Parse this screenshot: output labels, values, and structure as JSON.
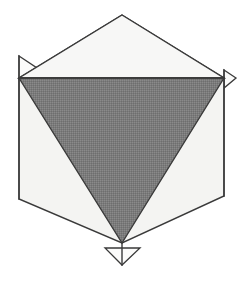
{
  "figure": {
    "type": "geometric-line-drawing",
    "width": 247,
    "height": 283,
    "background_color": "#ffffff",
    "colors": {
      "background": "#ffffff",
      "outline_stroke": "#3a3a3a",
      "light_face_fill": "#f4f4f2",
      "upper_face_fill": "#f7f7f6",
      "shaded_triangle_fill": "#787878",
      "flap_fill": "#fbfbfa"
    },
    "stroke_width": 1.4,
    "shapes": {
      "hexagon": {
        "name": "hexagon-outline",
        "fill": "#f4f4f2",
        "stroke": "#3a3a3a",
        "points": [
          [
            122,
            15
          ],
          [
            224,
            78
          ],
          [
            224,
            196
          ],
          [
            122,
            243
          ],
          [
            19,
            199
          ],
          [
            19,
            78
          ]
        ]
      },
      "upper_face": {
        "name": "upper-light-face",
        "fill": "#f7f7f6",
        "stroke": "#3a3a3a",
        "points": [
          [
            122,
            15
          ],
          [
            224,
            78
          ],
          [
            19,
            78
          ]
        ]
      },
      "shaded_triangle": {
        "name": "shaded-inverted-triangle",
        "fill": "#787878",
        "stroke": "#3a3a3a",
        "points": [
          [
            19,
            78
          ],
          [
            224,
            78
          ],
          [
            122,
            243
          ]
        ]
      },
      "flap_left": {
        "name": "left-flap-triangle",
        "fill": "#fbfbfa",
        "stroke": "#3a3a3a",
        "points": [
          [
            19,
            56
          ],
          [
            40,
            70
          ],
          [
            19,
            79
          ]
        ]
      },
      "flap_right": {
        "name": "right-flap-triangle",
        "fill": "#fbfbfa",
        "stroke": "#3a3a3a",
        "points": [
          [
            224,
            70
          ],
          [
            236,
            78
          ],
          [
            224,
            88
          ]
        ]
      },
      "flap_bottom": {
        "name": "bottom-flap-triangle",
        "fill": "#fbfbfa",
        "stroke": "#3a3a3a",
        "points": [
          [
            105,
            248
          ],
          [
            140,
            248
          ],
          [
            122,
            265
          ]
        ]
      }
    },
    "edges": {
      "left_vertical": {
        "name": "left-vertical-edge",
        "from": [
          19,
          56
        ],
        "to": [
          19,
          199
        ]
      },
      "right_vertical": {
        "name": "right-vertical-edge",
        "from": [
          224,
          70
        ],
        "to": [
          224,
          196
        ]
      },
      "center_vertical": {
        "name": "center-vertical-edge",
        "from": [
          122,
          243
        ],
        "to": [
          122,
          265
        ]
      },
      "horizontal_divider": {
        "name": "horizontal-divider-edge",
        "from": [
          19,
          78
        ],
        "to": [
          224,
          78
        ]
      }
    }
  }
}
